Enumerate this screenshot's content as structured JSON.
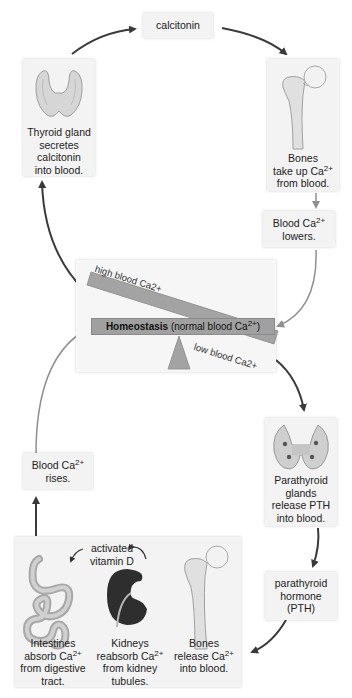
{
  "colors": {
    "box_bg": "#f3f3f3",
    "arrow_dark": "#3a3a3a",
    "arrow_light": "#9a9a9a",
    "beam": "#a3a3a3",
    "kidney": "#2e2e2e",
    "bone": "#e6e6e6"
  },
  "nodes": {
    "calcitonin": {
      "text": "calcitonin"
    },
    "thyroid": {
      "icon": "thyroid-gland-icon",
      "lines": [
        "Thyroid gland",
        "secretes",
        "calcitonin",
        "into blood."
      ]
    },
    "bones_take_up": {
      "icon": "femur-bone-icon",
      "line1": "Bones",
      "line2_pre": "take up Ca",
      "line2_sup": "2+",
      "line3": "from blood."
    },
    "blood_lowers": {
      "line1_pre": "Blood Ca",
      "line1_sup": "2+",
      "line2": "lowers."
    },
    "parathyroid": {
      "icon": "parathyroid-glands-icon",
      "lines": [
        "Parathyroid",
        "glands",
        "release PTH",
        "into blood."
      ]
    },
    "pth": {
      "lines": [
        "parathyroid",
        "hormone",
        "(PTH)"
      ]
    },
    "blood_rises": {
      "line1_pre": "Blood Ca",
      "line1_sup": "2+",
      "line2": "rises."
    },
    "effectors": {
      "vitamin_d_label": [
        "activated",
        "vitamin D"
      ],
      "intestines": {
        "icon": "intestines-icon",
        "line1": "Intestines",
        "line2_pre": "absorb Ca",
        "line2_sup": "2+",
        "line3": "from digestive",
        "line4": "tract."
      },
      "kidneys": {
        "icon": "kidney-icon",
        "line1": "Kidneys",
        "line2_pre": "reabsorb Ca",
        "line2_sup": "2+",
        "line3": "from kidney",
        "line4": "tubules."
      },
      "bones_release": {
        "icon": "femur-bone-icon",
        "line1": "Bones",
        "line2_pre": "release Ca",
        "line2_sup": "2+",
        "line3": "into blood."
      }
    }
  },
  "balance": {
    "high_label": "high blood Ca2+",
    "low_label": "low blood Ca2+",
    "homeostasis_bold": "Homeostasis",
    "homeostasis_rest_pre": " (normal blood Ca",
    "homeostasis_sup": "2+",
    "homeostasis_close": ")"
  }
}
